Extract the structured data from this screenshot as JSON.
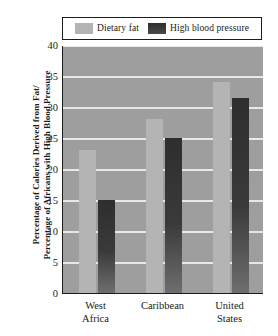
{
  "chart_data": {
    "type": "bar",
    "title": "",
    "xlabel": "",
    "ylabel_lines": [
      "Percentage of Calories Derived from Fat/",
      "Percentage of Africans with High Blood Pressure"
    ],
    "categories": [
      "West Africa",
      "Caribbean",
      "United States"
    ],
    "category_lines": [
      [
        "West",
        "Africa"
      ],
      [
        "Caribbean",
        ""
      ],
      [
        "United",
        "States"
      ]
    ],
    "series": [
      {
        "name": "Dietary fat",
        "color": "#b4b4b4",
        "values": [
          23,
          28,
          34
        ]
      },
      {
        "name": "High blood pressure",
        "color": "#333333",
        "values": [
          15,
          25,
          31.5
        ]
      }
    ],
    "ylim": [
      0,
      40
    ],
    "ytick_step": 5,
    "yticks": [
      0,
      5,
      10,
      15,
      20,
      25,
      30,
      35,
      40
    ],
    "ytick_labels": [
      "0",
      "5",
      "10",
      "15",
      "20",
      "25",
      "30",
      "35",
      "40"
    ],
    "grid": true,
    "grid_color": "#e8e8e8",
    "plot_background": "#9e9e9e",
    "legend_position": "top",
    "axis_color": "#1c1c1c"
  }
}
